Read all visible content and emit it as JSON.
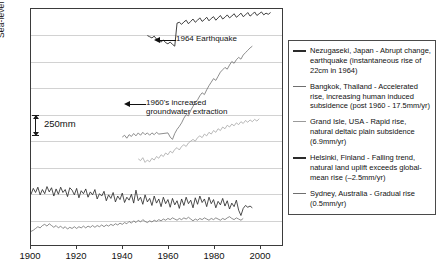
{
  "chart_data": {
    "type": "line",
    "title": "",
    "xlabel": "",
    "ylabel": "Sea-level records",
    "xlim": [
      1900,
      2010
    ],
    "ylim": [
      0,
      8
    ],
    "grid": true,
    "grid_orientation": "horizontal",
    "y_axis_units": "mm (relative, offset per station)",
    "scale_bar_label": "250mm",
    "legend_position": "right-outside",
    "x_ticks": [
      1900,
      1920,
      1940,
      1960,
      1980,
      2000
    ],
    "annotations": [
      {
        "id": "earthquake",
        "text": "1964 Earthquake",
        "points_to_year": 1964,
        "series": "Nezugaseki, Japan",
        "arrow": "left"
      },
      {
        "id": "groundwater",
        "line1": "1960's increased",
        "line2": "groundwater extraction",
        "points_to_year": 1960,
        "series": "Bangkok, Thailand",
        "arrow": "left"
      }
    ],
    "series": [
      {
        "name": "Nezugaseki, Japan",
        "legend_label": "Nezugaseki, Japan  - Abrupt change, earthquake (instantaneous rise of 22cm in 1964)",
        "color": "#2b2b2b",
        "description": "Abrupt change, earthquake (instantaneous rise of 22cm in 1964)",
        "trend": "step jump of 220mm at 1964",
        "x": [
          1951,
          1952,
          1953,
          1954,
          1955,
          1956,
          1957,
          1958,
          1959,
          1960,
          1961,
          1962,
          1963,
          1964,
          1965,
          1966,
          1967,
          1968,
          1969,
          1970,
          1971,
          1972,
          1973,
          1974,
          1975,
          1976,
          1977,
          1978,
          1979,
          1980,
          1981,
          1982,
          1983,
          1984,
          1985,
          1986,
          1987,
          1988,
          1989,
          1990,
          1991,
          1992,
          1993,
          1994,
          1995,
          1996,
          1997,
          1998,
          1999,
          2000,
          2001,
          2002,
          2003,
          2004,
          2005
        ],
        "values": [
          7.1,
          7.06,
          7.02,
          7.08,
          6.98,
          6.92,
          6.88,
          6.95,
          6.86,
          6.82,
          6.88,
          6.8,
          6.74,
          7.52,
          7.55,
          7.48,
          7.56,
          7.62,
          7.5,
          7.58,
          7.66,
          7.55,
          7.62,
          7.7,
          7.58,
          7.64,
          7.72,
          7.6,
          7.68,
          7.74,
          7.62,
          7.7,
          7.78,
          7.66,
          7.72,
          7.8,
          7.7,
          7.76,
          7.84,
          7.72,
          7.78,
          7.86,
          7.74,
          7.8,
          7.88,
          7.76,
          7.82,
          7.9,
          7.78,
          7.84,
          7.9,
          7.8,
          7.86,
          7.82,
          7.88
        ]
      },
      {
        "name": "Bangkok, Thailand",
        "legend_label": "Bangkok, Thailand  - Accelerated rise, increasing human induced subsidence (post 1960 - 17.5mm/yr)",
        "color": "#6f6f6f",
        "description": "Accelerated rise, increasing human induced subsidence (post 1960 - 17.5mm/yr)",
        "trend": "accelerated rise after 1960, 17.5 mm/yr",
        "x": [
          1940,
          1941,
          1942,
          1943,
          1944,
          1945,
          1946,
          1947,
          1948,
          1949,
          1950,
          1951,
          1952,
          1953,
          1954,
          1955,
          1956,
          1960,
          1961,
          1962,
          1963,
          1964,
          1965,
          1966,
          1967,
          1968,
          1969,
          1970,
          1971,
          1972,
          1973,
          1974,
          1975,
          1976,
          1977,
          1978,
          1979,
          1980,
          1981,
          1982,
          1983,
          1984,
          1985,
          1986,
          1987,
          1988,
          1989,
          1990,
          1991,
          1992,
          1993,
          1994,
          1995,
          1996,
          1997
        ],
        "values": [
          3.66,
          3.72,
          3.62,
          3.74,
          3.68,
          3.78,
          3.7,
          3.8,
          3.72,
          3.82,
          3.74,
          3.8,
          3.72,
          3.8,
          3.74,
          3.82,
          3.76,
          3.8,
          3.66,
          3.58,
          3.78,
          3.92,
          4.02,
          4.14,
          4.3,
          4.42,
          4.38,
          4.56,
          4.7,
          4.84,
          4.92,
          5.06,
          5.16,
          5.1,
          5.26,
          5.4,
          5.52,
          5.64,
          5.58,
          5.72,
          5.86,
          5.94,
          6.02,
          5.96,
          6.1,
          6.22,
          6.16,
          6.28,
          6.36,
          6.3,
          6.44,
          6.52,
          6.6,
          6.68,
          6.74
        ]
      },
      {
        "name": "Grand Isle, USA",
        "legend_label": "Grand Isle, USA  - Rapid rise, natural deltaic plain subsidence (6.9mm/yr)",
        "color": "#9a9a9a",
        "description": "Rapid rise, natural deltaic plain subsidence (6.9mm/yr)",
        "trend": "rapid steady rise 6.9 mm/yr",
        "x": [
          1947,
          1948,
          1949,
          1950,
          1951,
          1952,
          1953,
          1954,
          1955,
          1956,
          1957,
          1958,
          1959,
          1960,
          1961,
          1962,
          1963,
          1964,
          1965,
          1966,
          1967,
          1968,
          1969,
          1970,
          1971,
          1972,
          1973,
          1974,
          1975,
          1976,
          1977,
          1978,
          1979,
          1980,
          1981,
          1982,
          1983,
          1984,
          1985,
          1986,
          1987,
          1988,
          1989,
          1990,
          1991,
          1992,
          1993,
          1994,
          1995,
          1996,
          1997,
          1998,
          1999,
          2000
        ],
        "values": [
          2.92,
          2.86,
          2.96,
          2.8,
          2.88,
          2.82,
          2.94,
          2.88,
          3.0,
          2.94,
          3.06,
          3.0,
          3.12,
          3.06,
          3.18,
          3.12,
          3.24,
          3.3,
          3.22,
          3.34,
          3.4,
          3.34,
          3.46,
          3.52,
          3.58,
          3.52,
          3.64,
          3.7,
          3.64,
          3.76,
          3.7,
          3.82,
          3.76,
          3.88,
          3.82,
          3.94,
          3.88,
          4.0,
          3.94,
          4.06,
          4.0,
          4.1,
          4.04,
          4.14,
          4.08,
          4.18,
          4.12,
          4.22,
          4.16,
          4.24,
          4.18,
          4.26,
          4.2,
          4.28
        ]
      },
      {
        "name": "Helsinki, Finland",
        "legend_label": "Helsinki, Finland  - Falling trend, natural land uplift exceeds global-mean rise (–2.5mm/yr)",
        "color": "#2b2b2b",
        "description": "Falling trend, natural land uplift exceeds global-mean rise (-2.5mm/yr)",
        "trend": "falling trend -2.5 mm/yr with strong interannual noise",
        "x": [
          1900,
          1901,
          1902,
          1903,
          1904,
          1905,
          1906,
          1907,
          1908,
          1909,
          1910,
          1911,
          1912,
          1913,
          1914,
          1915,
          1916,
          1917,
          1918,
          1919,
          1920,
          1921,
          1922,
          1923,
          1924,
          1925,
          1926,
          1927,
          1928,
          1929,
          1930,
          1931,
          1932,
          1933,
          1934,
          1935,
          1936,
          1937,
          1938,
          1939,
          1940,
          1941,
          1942,
          1943,
          1944,
          1945,
          1946,
          1947,
          1948,
          1949,
          1950,
          1951,
          1952,
          1953,
          1954,
          1955,
          1956,
          1957,
          1958,
          1959,
          1960,
          1961,
          1962,
          1963,
          1964,
          1965,
          1966,
          1967,
          1968,
          1969,
          1970,
          1971,
          1972,
          1973,
          1974,
          1975,
          1976,
          1977,
          1978,
          1979,
          1980,
          1981,
          1982,
          1983,
          1984,
          1985,
          1986,
          1987,
          1988,
          1989,
          1990,
          1991,
          1992,
          1993,
          1994,
          1995,
          1996,
          1997
        ],
        "values": [
          1.72,
          1.92,
          1.78,
          1.96,
          1.7,
          1.88,
          1.74,
          1.98,
          1.8,
          1.94,
          1.66,
          1.9,
          1.72,
          1.96,
          1.78,
          1.88,
          1.64,
          1.94,
          1.86,
          1.7,
          1.92,
          1.6,
          1.84,
          1.74,
          1.9,
          1.62,
          1.8,
          1.7,
          1.88,
          1.56,
          1.74,
          1.66,
          1.82,
          1.5,
          1.7,
          1.58,
          1.78,
          1.46,
          1.66,
          1.54,
          1.76,
          1.44,
          1.62,
          1.52,
          1.72,
          1.42,
          1.86,
          1.5,
          1.62,
          1.38,
          1.7,
          1.46,
          1.58,
          1.34,
          1.66,
          1.42,
          1.56,
          1.3,
          1.62,
          1.4,
          1.54,
          1.28,
          1.58,
          1.36,
          1.5,
          1.24,
          1.56,
          1.34,
          1.62,
          1.4,
          1.52,
          1.26,
          1.6,
          1.38,
          1.66,
          1.44,
          1.56,
          1.3,
          1.62,
          1.4,
          1.54,
          1.26,
          1.48,
          1.36,
          1.58,
          1.32,
          1.5,
          1.22,
          1.42,
          1.3,
          1.52,
          1.18,
          1.0,
          1.24,
          1.34,
          1.28,
          1.32,
          1.26
        ]
      },
      {
        "name": "Sydney, Australia",
        "legend_label": "Sydney, Australia  - Gradual rise (0.5mm/yr)",
        "color": "#6f6f6f",
        "description": "Gradual rise (0.5mm/yr)",
        "trend": "gradual rise 0.5 mm/yr",
        "x": [
          1900,
          1901,
          1902,
          1903,
          1904,
          1905,
          1906,
          1907,
          1908,
          1909,
          1910,
          1911,
          1912,
          1913,
          1914,
          1915,
          1916,
          1917,
          1918,
          1919,
          1920,
          1921,
          1922,
          1923,
          1924,
          1925,
          1926,
          1927,
          1928,
          1929,
          1930,
          1931,
          1932,
          1933,
          1934,
          1935,
          1936,
          1937,
          1938,
          1939,
          1940,
          1941,
          1942,
          1943,
          1944,
          1945,
          1946,
          1947,
          1948,
          1949,
          1950,
          1951,
          1952,
          1953,
          1954,
          1955,
          1956,
          1957,
          1958,
          1959,
          1960,
          1961,
          1962,
          1963,
          1964,
          1965,
          1966,
          1967,
          1968,
          1969,
          1970,
          1971,
          1972,
          1973,
          1974,
          1975,
          1976,
          1977,
          1978,
          1979,
          1980,
          1981,
          1982,
          1983,
          1984,
          1985,
          1986,
          1987,
          1988,
          1989,
          1990,
          1991,
          1992,
          1993
        ],
        "values": [
          0.46,
          0.5,
          0.56,
          0.62,
          0.58,
          0.66,
          0.7,
          0.64,
          0.72,
          0.66,
          0.6,
          0.66,
          0.58,
          0.64,
          0.56,
          0.62,
          0.54,
          0.6,
          0.56,
          0.62,
          0.56,
          0.62,
          0.58,
          0.64,
          0.58,
          0.64,
          0.6,
          0.66,
          0.6,
          0.66,
          0.62,
          0.68,
          0.62,
          0.68,
          0.64,
          0.7,
          0.66,
          0.72,
          0.68,
          0.74,
          0.7,
          0.76,
          0.72,
          0.8,
          0.74,
          0.82,
          0.76,
          0.84,
          0.78,
          0.86,
          0.8,
          0.76,
          0.82,
          0.78,
          0.84,
          0.8,
          0.86,
          0.82,
          0.88,
          0.84,
          0.9,
          0.86,
          0.92,
          0.88,
          0.84,
          0.9,
          0.86,
          0.92,
          0.88,
          0.94,
          0.88,
          0.82,
          0.88,
          0.84,
          0.9,
          0.86,
          0.92,
          0.88,
          0.84,
          0.9,
          0.86,
          0.92,
          0.88,
          0.84,
          0.9,
          0.86,
          0.92,
          0.96,
          0.9,
          0.86,
          0.92,
          0.88,
          0.84,
          0.9
        ]
      }
    ]
  }
}
